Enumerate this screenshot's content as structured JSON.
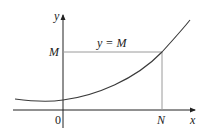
{
  "diagram": {
    "axes": {
      "x_label": "x",
      "y_label": "y",
      "origin_label": "0"
    },
    "labels": {
      "M": "M",
      "N": "N",
      "line_equation": "y = M"
    },
    "colors": {
      "curve": "#3a3a3a",
      "axes": "#222222",
      "guide_lines": "#9a9a9a",
      "background": "#ffffff"
    }
  }
}
